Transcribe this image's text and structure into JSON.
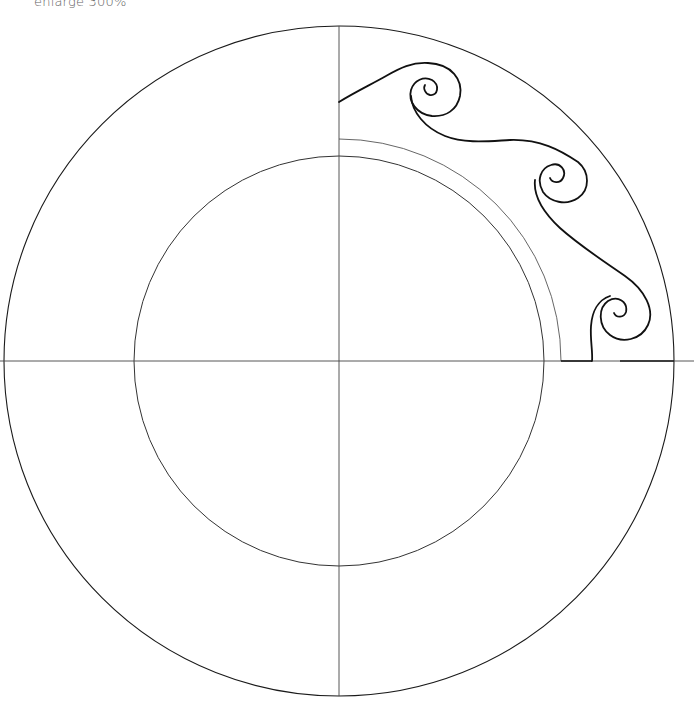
{
  "caption": "enlarge 300%",
  "colors": {
    "background": "#ffffff",
    "line": "#1a1a1a",
    "thin_line": "#555555",
    "caption": "#666666"
  },
  "diagram": {
    "center": [
      339,
      361
    ],
    "outer_circle_radius": 335,
    "inner_circle_radius": 205,
    "inner_arc_radius": 222,
    "axes": [
      "horizontal",
      "vertical"
    ],
    "motif": "three-spiral wave border in top-right quadrant"
  }
}
